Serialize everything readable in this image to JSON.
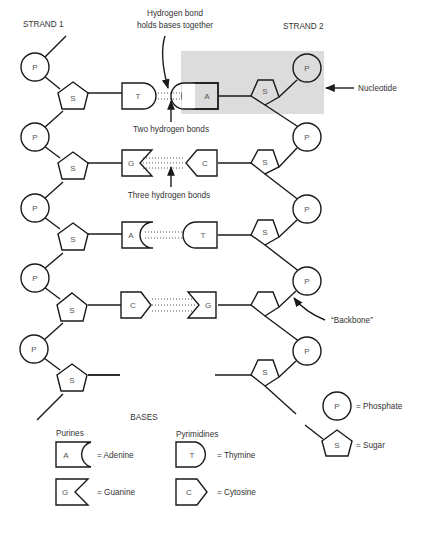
{
  "labels": {
    "strand1": "STRAND 1",
    "strand2": "STRAND 2",
    "hbond_title_line1": "Hydrogen bond",
    "hbond_title_line2": "holds bases together",
    "two_bonds": "Two hydrogen bonds",
    "three_bonds": "Three hydrogen bonds",
    "nucleotide": "Nucleotide",
    "backbone": "“Backbone”"
  },
  "symbols": {
    "phosphate": "P",
    "sugar": "S",
    "adenine": "A",
    "thymine": "T",
    "guanine": "G",
    "cytosine": "C"
  },
  "base_pairs": [
    {
      "left": "T",
      "right": "A",
      "bonds": 2
    },
    {
      "left": "G",
      "right": "C",
      "bonds": 3
    },
    {
      "left": "A",
      "right": "T",
      "bonds": 2
    },
    {
      "left": "C",
      "right": "G",
      "bonds": 3
    }
  ],
  "legend": {
    "bases_title": "BASES",
    "purines_title": "Purines",
    "pyrimidines_title": "Pyrimidines",
    "adenine": "= Adenine",
    "guanine": "= Guanine",
    "thymine": "= Thymine",
    "cytosine": "= Cytosine",
    "phosphate": "= Phosphate",
    "sugar": "= Sugar"
  },
  "colors": {
    "highlight": "#dcdcdc",
    "stroke": "#1a1a1a",
    "text": "#333333"
  }
}
